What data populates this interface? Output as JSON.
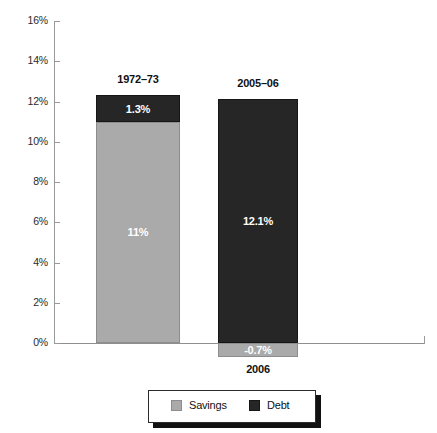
{
  "chart_data": {
    "type": "bar",
    "subtype": "stacked-with-negative",
    "title": "",
    "xlabel": "",
    "ylabel": "",
    "ylim": [
      0,
      16
    ],
    "ytick_labels": [
      "0%",
      "2%",
      "4%",
      "6%",
      "8%",
      "10%",
      "12%",
      "14%",
      "16%"
    ],
    "ytick_values": [
      0,
      2,
      4,
      6,
      8,
      10,
      12,
      14,
      16
    ],
    "grid": false,
    "legend_position": "bottom",
    "categories": [
      "1972–73",
      "2006"
    ],
    "column_headers": [
      "1972–73",
      "2005–06"
    ],
    "series": [
      {
        "name": "Savings",
        "color": "#aaaaaa",
        "values": [
          11.0,
          -0.7
        ],
        "labels": [
          "11%",
          "-0.7%"
        ]
      },
      {
        "name": "Debt",
        "color": "#262626",
        "values": [
          1.3,
          12.1
        ],
        "labels": [
          "1.3%",
          "12.1%"
        ]
      }
    ],
    "bars": [
      {
        "top_label": "1972–73",
        "bottom_label": "",
        "segments": [
          {
            "series": "Debt",
            "value": 1.3,
            "label": "1.3%",
            "from": 11.0,
            "to": 12.3
          },
          {
            "series": "Savings",
            "value": 11.0,
            "label": "11%",
            "from": 0.0,
            "to": 11.0
          }
        ]
      },
      {
        "top_label": "2005–06",
        "bottom_label": "2006",
        "segments": [
          {
            "series": "Debt",
            "value": 12.1,
            "label": "12.1%",
            "from": 0.0,
            "to": 12.1
          },
          {
            "series": "Savings",
            "value": -0.7,
            "label": "-0.7%",
            "from": -0.7,
            "to": 0.0
          }
        ]
      }
    ],
    "legend": [
      {
        "label": "Savings",
        "swatch": "savings"
      },
      {
        "label": "Debt",
        "swatch": "debt"
      }
    ],
    "colors": {
      "savings": "#aaaaaa",
      "debt": "#262626",
      "axis": "#9a9a9a",
      "text": "#111111",
      "background": "#ffffff"
    }
  }
}
